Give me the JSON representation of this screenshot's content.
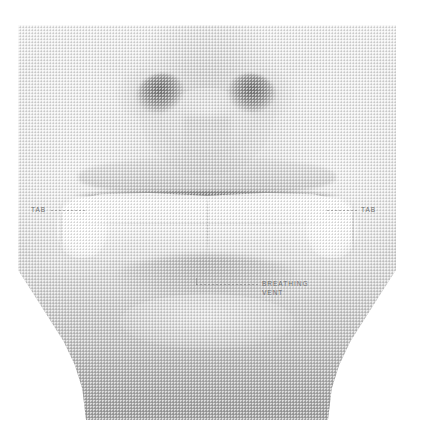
{
  "figure": {
    "type": "halftone-photograph",
    "visible_features": [
      "nose with two nostrils",
      "upper lip",
      "mouth line",
      "applied strip device spanning the mouth",
      "chin",
      "neck"
    ]
  },
  "annotations": [
    {
      "id": "tab-left",
      "label": "TAB",
      "position": "left",
      "leader": "dashed-horizontal",
      "points_to": "left wing of the strip device"
    },
    {
      "id": "tab-right",
      "label": "TAB",
      "position": "right",
      "leader": "dashed-horizontal",
      "points_to": "right wing of the strip device"
    },
    {
      "id": "breathing-vent",
      "label": "BREATHING\nVENT",
      "label_line_1": "BREATHING",
      "label_line_2": "VENT",
      "position": "lower-center-right",
      "leader": "dashed-horizontal-with-drop",
      "points_to": "center seam opening of the strip device"
    }
  ],
  "colors": {
    "page_background": "#ffffff",
    "plate_light": "#f2f2f2",
    "plate_mid": "#e6e6e6",
    "plate_dark": "#b6b6b6",
    "nostril": "#606060",
    "annotation_text": "#6e6e6e",
    "leader_line": "#787878",
    "device_highlight": "#ffffff"
  }
}
